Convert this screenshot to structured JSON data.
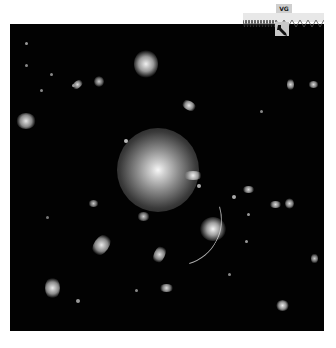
{
  "image": {
    "description": "Deep-field astronomical image of a galaxy cluster with a bright central elliptical galaxy and a gravitational lensing arc",
    "background_color": "#020202",
    "objects": [
      {
        "type": "central-galaxy",
        "x": 158,
        "y": 168,
        "rx": 36,
        "ry": 38,
        "core": "#f5f5f5"
      },
      {
        "type": "galaxy",
        "x": 146,
        "y": 63,
        "rx": 11,
        "ry": 13
      },
      {
        "type": "galaxy",
        "x": 26,
        "y": 120,
        "rx": 9,
        "ry": 7
      },
      {
        "type": "galaxy",
        "x": 78,
        "y": 86,
        "rx": 6,
        "ry": 3
      },
      {
        "type": "galaxy",
        "x": 99,
        "y": 82,
        "rx": 4,
        "ry": 5
      },
      {
        "type": "galaxy",
        "x": 189,
        "y": 106,
        "rx": 7,
        "ry": 4
      },
      {
        "type": "galaxy",
        "x": 290,
        "y": 84,
        "rx": 3,
        "ry": 6
      },
      {
        "type": "galaxy",
        "x": 313,
        "y": 84,
        "rx": 5,
        "ry": 3
      },
      {
        "type": "galaxy",
        "x": 193,
        "y": 175,
        "rx": 9,
        "ry": 4
      },
      {
        "type": "galaxy",
        "x": 212,
        "y": 229,
        "rx": 12,
        "ry": 11
      },
      {
        "type": "galaxy",
        "x": 101,
        "y": 245,
        "rx": 7,
        "ry": 11
      },
      {
        "type": "galaxy",
        "x": 52,
        "y": 289,
        "rx": 7,
        "ry": 10
      },
      {
        "type": "galaxy",
        "x": 160,
        "y": 255,
        "rx": 5,
        "ry": 9
      },
      {
        "type": "galaxy",
        "x": 167,
        "y": 289,
        "rx": 7,
        "ry": 4
      },
      {
        "type": "galaxy",
        "x": 283,
        "y": 306,
        "rx": 6,
        "ry": 5
      },
      {
        "type": "galaxy",
        "x": 249,
        "y": 189,
        "rx": 6,
        "ry": 3
      },
      {
        "type": "galaxy",
        "x": 276,
        "y": 204,
        "rx": 6,
        "ry": 3
      },
      {
        "type": "galaxy",
        "x": 289,
        "y": 203,
        "rx": 4,
        "ry": 5
      },
      {
        "type": "galaxy",
        "x": 314,
        "y": 258,
        "rx": 3,
        "ry": 5
      },
      {
        "type": "galaxy",
        "x": 93,
        "y": 203,
        "rx": 5,
        "ry": 3
      },
      {
        "type": "galaxy",
        "x": 143,
        "y": 216,
        "rx": 6,
        "ry": 4
      }
    ],
    "lensing_arc": {
      "from": [
        219,
        185
      ],
      "to": [
        181,
        223
      ]
    }
  },
  "overlay_widget": {
    "label": "VG",
    "icon": "telescope-pointer-icon"
  }
}
